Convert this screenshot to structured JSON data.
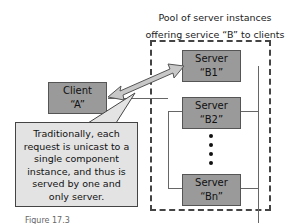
{
  "diagram": {
    "title_line1": "Pool of server instances",
    "title_line2": "offering service “B” to clients",
    "client": {
      "label": "Client",
      "name": "“A”"
    },
    "servers": [
      {
        "label": "Server",
        "name": "“B1”"
      },
      {
        "label": "Server",
        "name": "“B2”"
      },
      {
        "label": "Server",
        "name": "“Bn”"
      }
    ],
    "callout": {
      "lines": [
        "Traditionally, each",
        "request is unicast to a",
        "single component",
        "instance, and thus is",
        "served by one and",
        "only server."
      ]
    },
    "caption": "Figure 17.3",
    "colors": {
      "box_fill": "#9a9a9a",
      "callout_fill": "#e3e3e3",
      "arrow_fill": "#c8c8c8"
    }
  }
}
